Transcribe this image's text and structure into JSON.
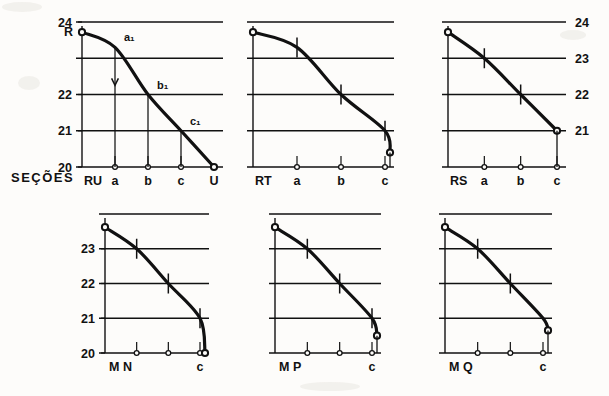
{
  "figure": {
    "axis_group_label": "SEÇÕES",
    "background": "#fdfcfa",
    "ink": "#111111"
  },
  "chart_data": [
    {
      "id": "panel-ru-u",
      "type": "line",
      "title": "",
      "row": 0,
      "col": 0,
      "xlabel": "",
      "ylabel": "",
      "ylim": [
        20,
        24
      ],
      "yticks": [
        24,
        23,
        22,
        21,
        20
      ],
      "ytick_labels": [
        "24",
        "",
        "22",
        "21",
        "20"
      ],
      "ytick_side": "left",
      "grid": true,
      "categories": [
        "RU",
        "a",
        "b",
        "c",
        "U"
      ],
      "x": [
        0,
        1,
        2,
        3,
        4
      ],
      "values": [
        23.72,
        23.3,
        22.0,
        21.0,
        20.0
      ],
      "point_markers": [
        "open-circle",
        "none",
        "none",
        "none",
        "open-circle"
      ],
      "curve_tick_marks": [],
      "annotations": [
        {
          "label": "a₁",
          "x": 1,
          "y": 23.3
        },
        {
          "label": "b₁",
          "x": 2,
          "y": 22.0
        },
        {
          "label": "c₁",
          "x": 3,
          "y": 21.0
        }
      ],
      "drop_lines": [
        {
          "x": 1,
          "from": 23.3,
          "to": 20.0,
          "arrow": true
        },
        {
          "x": 2,
          "from": 22.0,
          "to": 20.0,
          "arrow": false
        },
        {
          "x": 3,
          "from": 21.0,
          "to": 20.0,
          "arrow": false
        }
      ],
      "baseline_markers": [
        "a",
        "b",
        "c"
      ],
      "origin_label": "R"
    },
    {
      "id": "panel-rt-c",
      "type": "line",
      "title": "",
      "row": 0,
      "col": 1,
      "xlabel": "",
      "ylabel": "",
      "ylim": [
        20,
        24
      ],
      "yticks": [
        24,
        23,
        22,
        21,
        20
      ],
      "ytick_labels": [
        "",
        "",
        "",
        "",
        ""
      ],
      "ytick_side": "none",
      "grid": true,
      "categories": [
        "RT",
        "a",
        "b",
        "c"
      ],
      "x": [
        0,
        1,
        2,
        3
      ],
      "values": [
        23.72,
        23.3,
        22.0,
        21.0
      ],
      "point_markers": [
        "open-circle",
        "none",
        "none",
        "none"
      ],
      "curve_tick_marks": [
        1,
        2,
        3
      ],
      "annotations": [],
      "drop_lines": [],
      "baseline_markers": [
        "a",
        "b",
        "c"
      ],
      "end_marker": "open-circle",
      "end_value": 20.4,
      "origin_label": ""
    },
    {
      "id": "panel-rs-c",
      "type": "line",
      "title": "",
      "row": 0,
      "col": 2,
      "xlabel": "",
      "ylabel": "",
      "ylim": [
        20,
        24
      ],
      "yticks": [
        24,
        23,
        22,
        21,
        20
      ],
      "ytick_labels": [
        "24",
        "23",
        "22",
        "21",
        ""
      ],
      "ytick_side": "right",
      "grid": true,
      "categories": [
        "RS",
        "a",
        "b",
        "c"
      ],
      "x": [
        0,
        1,
        2,
        3
      ],
      "values": [
        23.72,
        23.0,
        22.0,
        21.0
      ],
      "point_markers": [
        "open-circle",
        "none",
        "none",
        "open-circle"
      ],
      "curve_tick_marks": [
        1,
        2
      ],
      "annotations": [],
      "drop_lines": [],
      "baseline_markers": [
        "a",
        "b",
        "c"
      ],
      "origin_label": ""
    },
    {
      "id": "panel-mn-c",
      "type": "line",
      "title": "",
      "row": 1,
      "col": 0,
      "xlabel": "",
      "ylabel": "",
      "ylim": [
        20,
        24
      ],
      "yticks": [
        24,
        23,
        22,
        21,
        20
      ],
      "ytick_labels": [
        "",
        "23",
        "22",
        "21",
        "20"
      ],
      "ytick_side": "left",
      "grid": true,
      "categories": [
        "M N",
        "",
        "",
        "c"
      ],
      "x": [
        0,
        1,
        2,
        3
      ],
      "values": [
        23.62,
        23.0,
        22.0,
        21.0
      ],
      "point_markers": [
        "open-circle",
        "none",
        "none",
        "none"
      ],
      "curve_tick_marks": [
        1,
        2,
        3
      ],
      "annotations": [],
      "drop_lines": [],
      "baseline_markers": [
        "",
        "",
        ""
      ],
      "end_marker": "open-circle",
      "end_value": 20.0,
      "origin_label": ""
    },
    {
      "id": "panel-mp-c",
      "type": "line",
      "title": "",
      "row": 1,
      "col": 1,
      "xlabel": "",
      "ylabel": "",
      "ylim": [
        20,
        24
      ],
      "yticks": [
        24,
        23,
        22,
        21,
        20
      ],
      "ytick_labels": [
        "",
        "",
        "",
        "",
        ""
      ],
      "ytick_side": "none",
      "grid": true,
      "categories": [
        "M P",
        "",
        "",
        "c"
      ],
      "x": [
        0,
        1,
        2,
        3
      ],
      "values": [
        23.62,
        23.0,
        22.0,
        21.0
      ],
      "point_markers": [
        "open-circle",
        "none",
        "none",
        "none"
      ],
      "curve_tick_marks": [
        1,
        2,
        3
      ],
      "annotations": [],
      "drop_lines": [],
      "baseline_markers": [
        "",
        "",
        ""
      ],
      "end_marker": "open-circle",
      "end_value": 20.5,
      "origin_label": ""
    },
    {
      "id": "panel-mq-c",
      "type": "line",
      "title": "",
      "row": 1,
      "col": 2,
      "xlabel": "",
      "ylabel": "",
      "ylim": [
        20,
        24
      ],
      "yticks": [
        24,
        23,
        22,
        21,
        20
      ],
      "ytick_labels": [
        "",
        "",
        "",
        "",
        ""
      ],
      "ytick_side": "none",
      "grid": true,
      "categories": [
        "M Q",
        "",
        "",
        "c"
      ],
      "x": [
        0,
        1,
        2,
        3
      ],
      "values": [
        23.62,
        23.0,
        22.0,
        21.0
      ],
      "point_markers": [
        "open-circle",
        "none",
        "none",
        "none"
      ],
      "curve_tick_marks": [
        1,
        2
      ],
      "annotations": [],
      "drop_lines": [],
      "baseline_markers": [
        "",
        "",
        ""
      ],
      "end_marker": "open-circle",
      "end_value": 20.65,
      "origin_label": ""
    }
  ]
}
